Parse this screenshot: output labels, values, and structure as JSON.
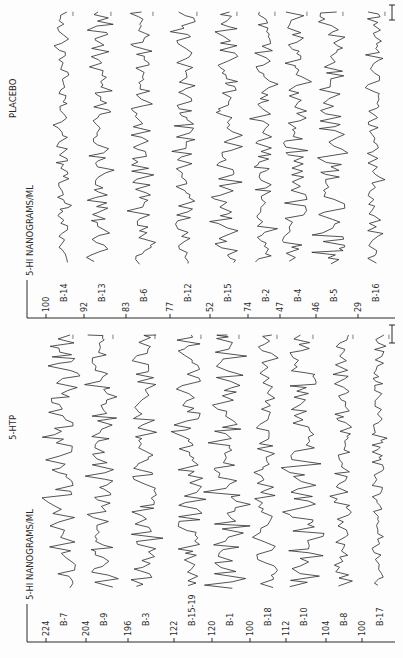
{
  "chart_data": [
    {
      "type": "line",
      "title": "5-HTP",
      "ylabel": "5-HI NANOGRAMS/ML",
      "orientation": "rotated-90-ccw",
      "series": [
        {
          "name": "B-7",
          "baseline": 224
        },
        {
          "name": "B-9",
          "baseline": 204
        },
        {
          "name": "B-3",
          "baseline": 196
        },
        {
          "name": "B-15-19",
          "baseline": 122
        },
        {
          "name": "B-1",
          "baseline": 120
        },
        {
          "name": "B-18",
          "baseline": 100
        },
        {
          "name": "B-10",
          "baseline": 112
        },
        {
          "name": "B-8",
          "baseline": 104
        },
        {
          "name": "B-17",
          "baseline": 100
        }
      ]
    },
    {
      "type": "line",
      "title": "PLACEBO",
      "ylabel": "5-HI NANOGRAMS/ML",
      "orientation": "rotated-90-ccw",
      "series": [
        {
          "name": "B-14",
          "baseline": 100
        },
        {
          "name": "B-13",
          "baseline": 92
        },
        {
          "name": "B-6",
          "baseline": 83
        },
        {
          "name": "B-12",
          "baseline": 77
        },
        {
          "name": "B-15",
          "baseline": 52
        },
        {
          "name": "B-2",
          "baseline": 74
        },
        {
          "name": "B-4",
          "baseline": 47
        },
        {
          "name": "B-5",
          "baseline": 46
        },
        {
          "name": "B-16",
          "baseline": 29
        }
      ]
    }
  ],
  "panels": {
    "htp": {
      "title": "5-HTP",
      "axis_label": "5-HI NANOGRAMS/ML",
      "subjects": [
        "B-7",
        "B-9",
        "B-3",
        "B-15-19",
        "B-1",
        "B-18",
        "B-10",
        "B-8",
        "B-17"
      ],
      "values": [
        "224",
        "204",
        "196",
        "122",
        "120",
        "100",
        "112",
        "104",
        "100"
      ]
    },
    "placebo": {
      "title": "PLACEBO",
      "axis_label": "5-HI NANOGRAMS/ML",
      "subjects": [
        "B-14",
        "B-13",
        "B-6",
        "B-12",
        "B-15",
        "B-2",
        "B-4",
        "B-5",
        "B-16"
      ],
      "values": [
        "100",
        "92",
        "83",
        "77",
        "52",
        "74",
        "47",
        "46",
        "29"
      ]
    }
  },
  "colors": {
    "ink": "#2a2a2a",
    "paper": "#fdfdfd"
  }
}
